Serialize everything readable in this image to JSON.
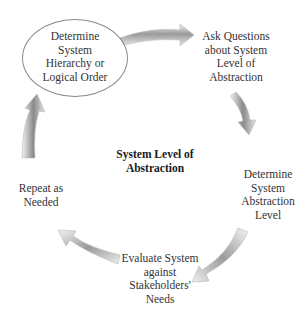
{
  "diagram": {
    "center_label": [
      "System Level of",
      "Abstraction"
    ],
    "steps": [
      {
        "id": "step-1",
        "lines": [
          "Determine",
          "System",
          "Hierarchy or",
          "Logical Order"
        ],
        "highlighted": true
      },
      {
        "id": "step-2",
        "lines": [
          "Ask Questions",
          "about System",
          "Level of",
          "Abstraction"
        ]
      },
      {
        "id": "step-3",
        "lines": [
          "Determine",
          "System",
          "Abstraction",
          "Level"
        ]
      },
      {
        "id": "step-4",
        "lines": [
          "Evaluate System",
          "against",
          "Stakeholders'",
          "Needs"
        ]
      },
      {
        "id": "step-5",
        "lines": [
          "Repeat as",
          "Needed"
        ]
      }
    ],
    "flow": [
      "step-1 -> step-2",
      "step-2 -> step-3",
      "step-3 -> step-4",
      "step-4 -> step-5",
      "step-5 -> step-1"
    ],
    "colors": {
      "arrow_light": "#f4f4f4",
      "arrow_dark": "#8c8c8c",
      "ellipse_border": "#8a8a8a",
      "text": "#333333"
    }
  }
}
